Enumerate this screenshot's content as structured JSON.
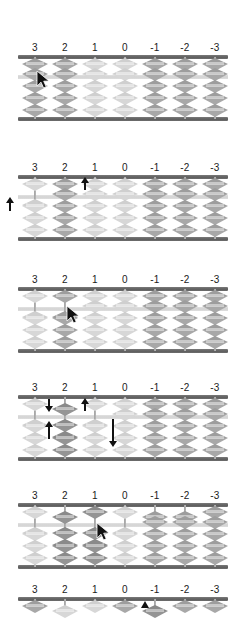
{
  "figure": {
    "kind": "soroban-abacus-step-sequence",
    "column_labels": [
      "3",
      "2",
      "1",
      "0",
      "-1",
      "-2",
      "-3"
    ],
    "rods_per_abacus": 7,
    "heaven_beads_per_rod": 1,
    "earth_beads_per_rod": 4,
    "colors": {
      "rail": "#5e5e5e",
      "divider": "#d3d3d3",
      "rod": "#9e9e9e",
      "bead": "#a8a8a8",
      "bead_light": "#d3d3d3",
      "bead_dark": "#8f8f8f",
      "annotation": "#111111",
      "label_text": "#1a1a1a",
      "background": "#ffffff"
    }
  },
  "abacuses": [
    {
      "name": "abacus-step-1",
      "labels": [
        "3",
        "2",
        "1",
        "0",
        "-1",
        "-2",
        "-3"
      ],
      "rods": [
        {
          "label": "3",
          "heaven_down": false,
          "earth_up": 0,
          "shade": "mid"
        },
        {
          "label": "2",
          "heaven_down": false,
          "earth_up": 0,
          "shade": "mid"
        },
        {
          "label": "1",
          "heaven_down": false,
          "earth_up": 0,
          "shade": "light"
        },
        {
          "label": "0",
          "heaven_down": false,
          "earth_up": 0,
          "shade": "light"
        },
        {
          "label": "-1",
          "heaven_down": false,
          "earth_up": 0,
          "shade": "mid"
        },
        {
          "label": "-2",
          "heaven_down": false,
          "earth_up": 0,
          "shade": "mid"
        },
        {
          "label": "-3",
          "heaven_down": false,
          "earth_up": 0,
          "shade": "mid"
        }
      ],
      "annotations": [
        {
          "type": "cursor",
          "rod": "3",
          "note": "pointer at rod 3 upper earth bead"
        }
      ]
    },
    {
      "name": "abacus-step-2",
      "labels": [
        "3",
        "2",
        "1",
        "0",
        "-1",
        "-2",
        "-3"
      ],
      "rods": [
        {
          "label": "3",
          "heaven_down": false,
          "earth_up": 1,
          "shade": "light"
        },
        {
          "label": "2",
          "heaven_down": false,
          "earth_up": 0,
          "shade": "mid"
        },
        {
          "label": "1",
          "heaven_down": false,
          "earth_up": 0,
          "shade": "light"
        },
        {
          "label": "0",
          "heaven_down": false,
          "earth_up": 0,
          "shade": "light"
        },
        {
          "label": "-1",
          "heaven_down": false,
          "earth_up": 0,
          "shade": "mid"
        },
        {
          "label": "-2",
          "heaven_down": false,
          "earth_up": 0,
          "shade": "mid"
        },
        {
          "label": "-3",
          "heaven_down": false,
          "earth_up": 0,
          "shade": "mid"
        }
      ],
      "annotations": [
        {
          "type": "arrow-up",
          "note": "arrow up left of rod 3"
        },
        {
          "type": "arrow-up",
          "note": "arrow up between rod 2 and rod 1"
        }
      ]
    },
    {
      "name": "abacus-step-3",
      "labels": [
        "3",
        "2",
        "1",
        "0",
        "-1",
        "-2",
        "-3"
      ],
      "rods": [
        {
          "label": "3",
          "heaven_down": false,
          "earth_up": 1,
          "shade": "light"
        },
        {
          "label": "2",
          "heaven_down": false,
          "earth_up": 1,
          "shade": "mid"
        },
        {
          "label": "1",
          "heaven_down": false,
          "earth_up": 0,
          "shade": "light"
        },
        {
          "label": "0",
          "heaven_down": false,
          "earth_up": 0,
          "shade": "light"
        },
        {
          "label": "-1",
          "heaven_down": false,
          "earth_up": 0,
          "shade": "mid"
        },
        {
          "label": "-2",
          "heaven_down": false,
          "earth_up": 0,
          "shade": "mid"
        },
        {
          "label": "-3",
          "heaven_down": false,
          "earth_up": 0,
          "shade": "mid"
        }
      ],
      "annotations": [
        {
          "type": "cursor",
          "rod": "2",
          "note": "pointer at rod 2 below divider"
        }
      ]
    },
    {
      "name": "abacus-step-4",
      "labels": [
        "3",
        "2",
        "1",
        "0",
        "-1",
        "-2",
        "-3"
      ],
      "rods": [
        {
          "label": "3",
          "heaven_down": false,
          "earth_up": 1,
          "shade": "light"
        },
        {
          "label": "2",
          "heaven_down": true,
          "earth_up": 2,
          "shade": "dark"
        },
        {
          "label": "1",
          "heaven_down": false,
          "earth_up": 1,
          "shade": "light"
        },
        {
          "label": "0",
          "heaven_down": false,
          "earth_up": 0,
          "shade": "light"
        },
        {
          "label": "-1",
          "heaven_down": false,
          "earth_up": 0,
          "shade": "mid"
        },
        {
          "label": "-2",
          "heaven_down": false,
          "earth_up": 0,
          "shade": "mid"
        },
        {
          "label": "-3",
          "heaven_down": false,
          "earth_up": 0,
          "shade": "mid"
        }
      ],
      "annotations": [
        {
          "type": "arrow-down",
          "note": "short down arrow left of rod 2 heaven bead"
        },
        {
          "type": "arrow-up",
          "note": "up arrow left of rod 2 earth beads"
        },
        {
          "type": "arrow-up",
          "note": "short up arrow right of rod 1 heaven area"
        },
        {
          "type": "arrow-down",
          "note": "long down arrow right of rod 1 earth beads"
        }
      ]
    },
    {
      "name": "abacus-step-5",
      "labels": [
        "3",
        "2",
        "1",
        "0",
        "-1",
        "-2",
        "-3"
      ],
      "rods": [
        {
          "label": "3",
          "heaven_down": false,
          "earth_up": 1,
          "shade": "light"
        },
        {
          "label": "2",
          "heaven_down": true,
          "earth_up": 2,
          "shade": "dark"
        },
        {
          "label": "1",
          "heaven_down": false,
          "earth_up": 2,
          "shade": "dark"
        },
        {
          "label": "0",
          "heaven_down": false,
          "earth_up": 1,
          "shade": "light"
        },
        {
          "label": "-1",
          "heaven_down": true,
          "earth_up": 0,
          "shade": "mid"
        },
        {
          "label": "-2",
          "heaven_down": true,
          "earth_up": 0,
          "shade": "mid"
        },
        {
          "label": "-3",
          "heaven_down": false,
          "earth_up": 0,
          "shade": "mid"
        }
      ],
      "annotations": [
        {
          "type": "cursor",
          "rod": "1",
          "note": "pointer at rod 1 below divider"
        }
      ]
    },
    {
      "name": "abacus-step-6",
      "labels": [
        "3",
        "2",
        "1",
        "0",
        "-1",
        "-2",
        "-3"
      ],
      "clipped": true,
      "rods": [
        {
          "label": "3",
          "heaven_down": false,
          "earth_up": 0,
          "shade": "mid"
        },
        {
          "label": "2",
          "heaven_down": true,
          "earth_up": 0,
          "shade": "light"
        },
        {
          "label": "1",
          "heaven_down": false,
          "earth_up": 0,
          "shade": "light"
        },
        {
          "label": "0",
          "heaven_down": false,
          "earth_up": 0,
          "shade": "mid"
        },
        {
          "label": "-1",
          "heaven_down": true,
          "earth_up": 0,
          "shade": "dark"
        },
        {
          "label": "-2",
          "heaven_down": false,
          "earth_up": 0,
          "shade": "mid"
        },
        {
          "label": "-3",
          "heaven_down": false,
          "earth_up": 0,
          "shade": "mid"
        }
      ],
      "annotations": [
        {
          "type": "arrow-up",
          "note": "small up triangle left of rod -1"
        }
      ]
    }
  ]
}
